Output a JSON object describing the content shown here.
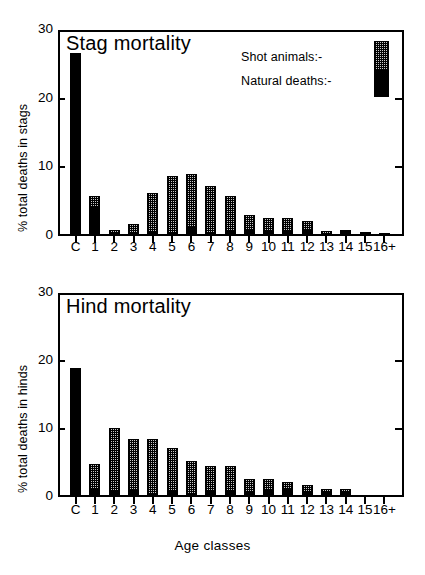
{
  "figure": {
    "xaxis_title": "Age classes"
  },
  "legend": {
    "shot_label": "Shot animals:-",
    "natural_label": "Natural deaths:-",
    "shot_color": "#c8c8c8",
    "natural_color": "#000000"
  },
  "chart_data": [
    {
      "type": "bar",
      "stacked": true,
      "title": "Stag mortality",
      "xlabel": "Age classes",
      "ylabel": "% total deaths in stags",
      "ylim": [
        0,
        30
      ],
      "yticks": [
        0,
        10,
        20,
        30
      ],
      "grid": false,
      "legend_position": "top-right",
      "categories": [
        "C",
        "1",
        "2",
        "3",
        "4",
        "5",
        "6",
        "7",
        "8",
        "9",
        "10",
        "11",
        "12",
        "13",
        "14",
        "15",
        "16+"
      ],
      "series": [
        {
          "name": "Natural deaths:-",
          "values": [
            26.6,
            4.1,
            0.35,
            0.4,
            0.4,
            0.4,
            1.3,
            0.4,
            0.8,
            0.8,
            0.8,
            0.8,
            0.8,
            0.35,
            0.9,
            0.25,
            0.45
          ]
        },
        {
          "name": "Shot animals:-",
          "values": [
            0.0,
            1.8,
            0.55,
            1.4,
            5.9,
            8.3,
            7.8,
            6.9,
            5.0,
            2.3,
            1.8,
            1.8,
            1.4,
            0.1,
            0.0,
            0.1,
            0.0
          ]
        }
      ],
      "totals": [
        26.6,
        5.9,
        0.9,
        1.8,
        6.3,
        8.7,
        9.1,
        7.3,
        5.8,
        3.1,
        2.6,
        2.6,
        2.2,
        0.45,
        0.9,
        0.35,
        0.45
      ]
    },
    {
      "type": "bar",
      "stacked": true,
      "title": "Hind mortality",
      "xlabel": "Age classes",
      "ylabel": "% total deaths in hinds",
      "ylim": [
        0,
        30
      ],
      "yticks": [
        0,
        10,
        20,
        30
      ],
      "grid": false,
      "legend_position": "none",
      "categories": [
        "C",
        "1",
        "2",
        "3",
        "4",
        "5",
        "6",
        "7",
        "8",
        "9",
        "10",
        "11",
        "12",
        "13",
        "14",
        "15",
        "16+"
      ],
      "series": [
        {
          "name": "Natural deaths:-",
          "values": [
            19.0,
            1.2,
            0.9,
            0.9,
            0.4,
            0.9,
            0.4,
            0.9,
            0.9,
            0.8,
            0.9,
            1.1,
            0.8,
            0.75,
            0.8,
            0.35,
            0.35
          ]
        },
        {
          "name": "Shot animals:-",
          "values": [
            0.0,
            3.7,
            9.2,
            7.7,
            8.2,
            6.3,
            4.9,
            3.6,
            3.6,
            1.8,
            1.8,
            1.1,
            0.9,
            0.1,
            0.1,
            0.0,
            0.0
          ]
        }
      ],
      "totals": [
        19.0,
        4.9,
        10.1,
        8.6,
        8.6,
        7.2,
        5.3,
        4.5,
        4.5,
        2.6,
        2.7,
        2.2,
        1.7,
        0.85,
        0.9,
        0.35,
        0.35
      ]
    }
  ]
}
